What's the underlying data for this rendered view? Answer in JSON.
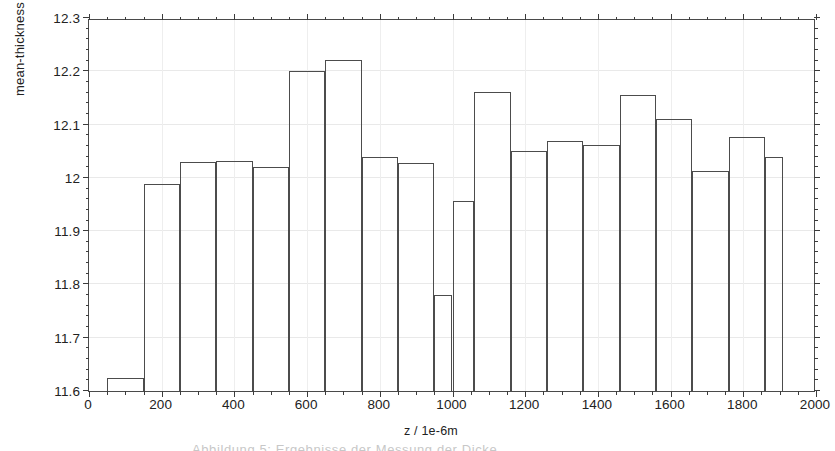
{
  "chart_data": {
    "type": "bar",
    "title": "",
    "subtitle": "",
    "xlabel": "z / 1e-6m",
    "ylabel": "mean-thickness / 1e-6m",
    "xlim": [
      0,
      2000
    ],
    "ylim": [
      11.6,
      12.3
    ],
    "grid": true,
    "legend": null,
    "legend_position": "none",
    "xticks": [
      0,
      200,
      400,
      600,
      800,
      1000,
      1200,
      1400,
      1600,
      1800,
      2000
    ],
    "xtick_labels": [
      "0",
      "200",
      "400",
      "600",
      "800",
      "1000",
      "1200",
      "1400",
      "1600",
      "1800",
      "2000"
    ],
    "yticks": [
      11.6,
      11.7,
      11.8,
      11.9,
      12.0,
      12.1,
      12.2,
      12.3
    ],
    "ytick_labels": [
      "11.6",
      "11.7",
      "11.8",
      "11.9",
      "12",
      "12.1",
      "12.2",
      "12.3"
    ],
    "xtick_minor_step": 50,
    "ytick_minor_step": 0.02,
    "bar_style": "outline",
    "bar_edge_color": "#4c4c4c",
    "bar_fill_color": "transparent",
    "bins": [
      {
        "x0": 50,
        "x1": 150,
        "value": 11.625
      },
      {
        "x0": 150,
        "x1": 250,
        "value": 11.988
      },
      {
        "x0": 250,
        "x1": 350,
        "value": 12.029
      },
      {
        "x0": 350,
        "x1": 450,
        "value": 12.032
      },
      {
        "x0": 450,
        "x1": 550,
        "value": 12.021
      },
      {
        "x0": 550,
        "x1": 650,
        "value": 12.2
      },
      {
        "x0": 650,
        "x1": 750,
        "value": 12.221
      },
      {
        "x0": 750,
        "x1": 850,
        "value": 12.04
      },
      {
        "x0": 850,
        "x1": 950,
        "value": 12.028
      },
      {
        "x0": 950,
        "x1": 1000,
        "value": 11.78
      },
      {
        "x0": 1000,
        "x1": 1060,
        "value": 11.957
      },
      {
        "x0": 1060,
        "x1": 1160,
        "value": 12.161
      },
      {
        "x0": 1160,
        "x1": 1260,
        "value": 12.05
      },
      {
        "x0": 1260,
        "x1": 1360,
        "value": 12.069
      },
      {
        "x0": 1360,
        "x1": 1460,
        "value": 12.061
      },
      {
        "x0": 1460,
        "x1": 1560,
        "value": 12.156
      },
      {
        "x0": 1560,
        "x1": 1660,
        "value": 12.11
      },
      {
        "x0": 1660,
        "x1": 1760,
        "value": 12.012
      },
      {
        "x0": 1760,
        "x1": 1860,
        "value": 12.077
      },
      {
        "x0": 1860,
        "x1": 1910,
        "value": 12.04
      }
    ]
  },
  "caption": {
    "clipped_text": "Abbildung 5: Ergebnisse der Messung der Dicke"
  }
}
